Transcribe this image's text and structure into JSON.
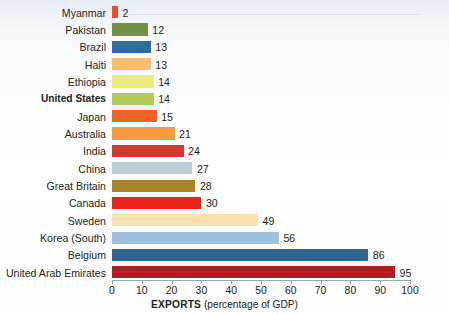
{
  "chart_data": {
    "type": "bar",
    "orientation": "horizontal",
    "title": "",
    "xlabel": "EXPORTS (percentage of GDP)",
    "xlabel_bold_part": "EXPORTS",
    "xlabel_plain_part": " (percentage of GDP)",
    "ylabel": "",
    "xlim": [
      0,
      100
    ],
    "xticks": [
      0,
      10,
      20,
      30,
      40,
      50,
      60,
      70,
      80,
      90,
      100
    ],
    "xtick_labels": [
      "0",
      "10",
      "20",
      "30",
      "40",
      "50",
      "60",
      "70",
      "80",
      "90",
      "100"
    ],
    "grid": false,
    "legend": "none",
    "categories": [
      "Myanmar",
      "Pakistan",
      "Brazil",
      "Haiti",
      "Ethiopia",
      "United States",
      "Japan",
      "Australia",
      "India",
      "China",
      "Great Britain",
      "Canada",
      "Sweden",
      "Korea (South)",
      "Belgium",
      "United Arab Emirates"
    ],
    "values": [
      2,
      12,
      13,
      13,
      14,
      14,
      15,
      21,
      24,
      27,
      28,
      30,
      49,
      56,
      86,
      95
    ],
    "value_labels": [
      "2",
      "12",
      "13",
      "13",
      "14",
      "14",
      "15",
      "21",
      "24",
      "27",
      "28",
      "30",
      "49",
      "56",
      "86",
      "95"
    ],
    "bar_colors": [
      "#ef4a2b",
      "#6f9141",
      "#2d6e98",
      "#f9bd74",
      "#ebe87e",
      "#b4cb58",
      "#f1622a",
      "#f59a45",
      "#cf3a2e",
      "#b9cdd6",
      "#a8812a",
      "#e8241c",
      "#f7e2af",
      "#9cc0dd",
      "#2b6590",
      "#ae1f24"
    ],
    "highlighted_category": "United States",
    "axis_color": "#9aa5b1",
    "text_color": "#231f20",
    "background_color": "#ffffff"
  }
}
